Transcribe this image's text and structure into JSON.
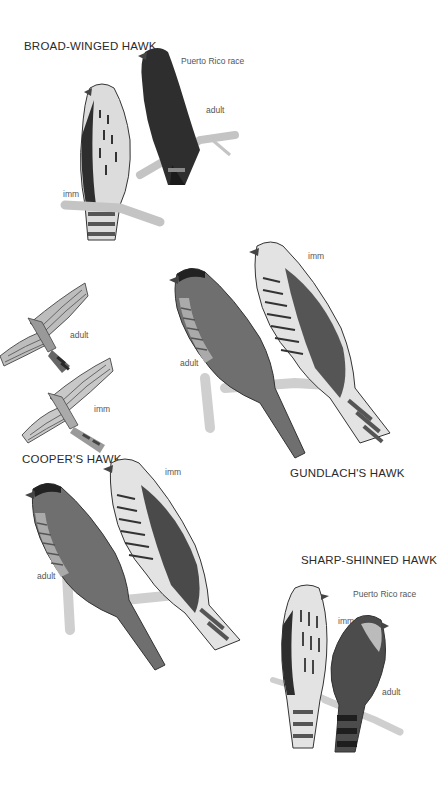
{
  "plate": {
    "species": [
      {
        "name": "BROAD-WINGED HAWK",
        "labels": [
          "Puerto Rico race",
          "adult",
          "imm"
        ]
      },
      {
        "name": "GUNDLACH'S HAWK",
        "labels": [
          "imm",
          "adult"
        ]
      },
      {
        "name": "COOPER'S HAWK",
        "labels": [
          "imm",
          "adult"
        ],
        "flight_labels": [
          "adult",
          "imm"
        ]
      },
      {
        "name": "SHARP-SHINNED HAWK",
        "labels": [
          "Puerto Rico race",
          "imm",
          "adult"
        ]
      }
    ]
  },
  "colors": {
    "background": "#ffffff",
    "text": "#2a2a2a",
    "bird_dark": "#2b2b2b",
    "bird_mid": "#6a6a6a",
    "bird_light": "#d8d8d8",
    "branch": "#c9c9c9"
  }
}
